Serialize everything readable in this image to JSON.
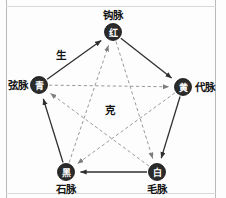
{
  "diagram": {
    "title": "",
    "background_color": "#fdfdfd",
    "node_fill_color": "#2b2b2b",
    "node_glyph_color": "#ffffff",
    "sheng_line_color": "#2f2f2f",
    "ke_line_color": "#8d8d8d",
    "annotations": [
      {
        "id": "sheng",
        "text": "生",
        "x": 61,
        "y": 55
      },
      {
        "id": "ke",
        "text": "克",
        "x": 110,
        "y": 110
      }
    ],
    "nodes": [
      {
        "id": "fire",
        "glyph": "红",
        "label": "钩脉",
        "x": 113,
        "y": 32,
        "r": 8.5,
        "label_x": 113,
        "label_y": 15
      },
      {
        "id": "earth",
        "glyph": "黄",
        "label": "代脉",
        "x": 183,
        "y": 87,
        "r": 8.5,
        "label_x": 205,
        "label_y": 87
      },
      {
        "id": "metal",
        "glyph": "白",
        "label": "毛脉",
        "x": 157,
        "y": 172,
        "r": 8.5,
        "label_x": 157,
        "label_y": 189
      },
      {
        "id": "water",
        "glyph": "黑",
        "label": "石脉",
        "x": 66,
        "y": 172,
        "r": 8.5,
        "label_x": 66,
        "label_y": 189
      },
      {
        "id": "wood",
        "glyph": "青",
        "label": "弦脉",
        "x": 39,
        "y": 85,
        "r": 8.5,
        "label_x": 18,
        "label_y": 85
      }
    ],
    "sheng_edges": [
      {
        "id": "wood-to-fire",
        "from": "wood",
        "to": "fire",
        "style": "solid"
      },
      {
        "id": "fire-to-earth",
        "from": "fire",
        "to": "earth",
        "style": "solid"
      },
      {
        "id": "earth-to-metal",
        "from": "earth",
        "to": "metal",
        "style": "solid"
      },
      {
        "id": "metal-to-water",
        "from": "metal",
        "to": "water",
        "style": "solid"
      },
      {
        "id": "water-to-wood",
        "from": "water",
        "to": "wood",
        "style": "solid"
      }
    ],
    "ke_edges": [
      {
        "id": "wood-to-earth",
        "from": "wood",
        "to": "earth",
        "style": "dashed"
      },
      {
        "id": "earth-to-water",
        "from": "earth",
        "to": "water",
        "style": "dashed"
      },
      {
        "id": "water-to-fire",
        "from": "water",
        "to": "fire",
        "style": "dashed"
      },
      {
        "id": "fire-to-metal",
        "from": "fire",
        "to": "metal",
        "style": "dashed"
      },
      {
        "id": "metal-to-wood",
        "from": "metal",
        "to": "wood",
        "style": "dashed"
      }
    ]
  }
}
